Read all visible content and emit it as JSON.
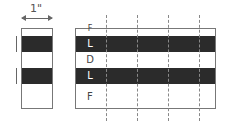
{
  "dimension": {
    "label": "1\""
  },
  "left_strip": {
    "bands": [
      "light",
      "dark",
      "light",
      "dark",
      "light"
    ]
  },
  "right_pattern": {
    "bands": [
      {
        "label": "F",
        "tone": "light"
      },
      {
        "label": "L",
        "tone": "dark"
      },
      {
        "label": "D",
        "tone": "light"
      },
      {
        "label": "L",
        "tone": "dark"
      },
      {
        "label": "F",
        "tone": "light"
      }
    ],
    "dashed_lines": 4
  },
  "colors": {
    "dark_band": "#2b2b2b",
    "frame": "#777777",
    "dashes": "#888888"
  }
}
